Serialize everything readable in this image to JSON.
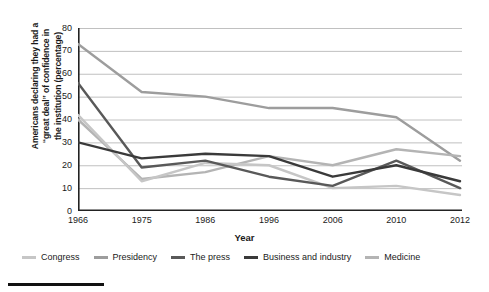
{
  "chart_data": {
    "type": "line",
    "title": "",
    "xlabel": "Year",
    "ylabel": "Americans declaring they had a \"great deal\" of confidence in the institution (percentage)",
    "categories": [
      "1966",
      "1975",
      "1986",
      "1996",
      "2006",
      "2010",
      "2012"
    ],
    "x": [
      1966,
      1975,
      1986,
      1996,
      2006,
      2010,
      2012
    ],
    "ylim": [
      0,
      80
    ],
    "yticks": [
      0,
      10,
      20,
      30,
      40,
      50,
      60,
      70,
      80
    ],
    "grid": true,
    "legend_position": "bottom",
    "series": [
      {
        "name": "Congress",
        "color": "#c6c6c6",
        "values": [
          42,
          13,
          21,
          20,
          10,
          11,
          7
        ]
      },
      {
        "name": "Presidency",
        "color": "#9d9d9d",
        "values": [
          73,
          52,
          50,
          45,
          45,
          41,
          22
        ]
      },
      {
        "name": "The press",
        "color": "#595959",
        "values": [
          56,
          19,
          22,
          15,
          11,
          22,
          10
        ]
      },
      {
        "name": "Business and industry",
        "color": "#3a3a3a",
        "values": [
          30,
          23,
          25,
          24,
          15,
          20,
          13
        ]
      },
      {
        "name": "Medicine",
        "color": "#b4b4b4",
        "values": [
          40,
          14,
          17,
          24,
          20,
          27,
          24
        ]
      }
    ]
  },
  "axes": {
    "ytick_labels": [
      "80",
      "70",
      "60",
      "50",
      "40",
      "30",
      "20",
      "10",
      "0"
    ],
    "xtick_labels": [
      "1966",
      "1975",
      "1986",
      "1996",
      "2006",
      "2010",
      "2012"
    ],
    "xlabel": "Year",
    "ylabel_line1": "Americans declaring they had a",
    "ylabel_line2": "“great deal” of confidence in",
    "ylabel_line3": "the institution (percentage)"
  },
  "legend": {
    "items": [
      {
        "label": "Congress",
        "color": "#c6c6c6"
      },
      {
        "label": "Presidency",
        "color": "#9d9d9d"
      },
      {
        "label": "The press",
        "color": "#595959"
      },
      {
        "label": "Business and industry",
        "color": "#3a3a3a"
      },
      {
        "label": "Medicine",
        "color": "#b4b4b4"
      }
    ]
  }
}
